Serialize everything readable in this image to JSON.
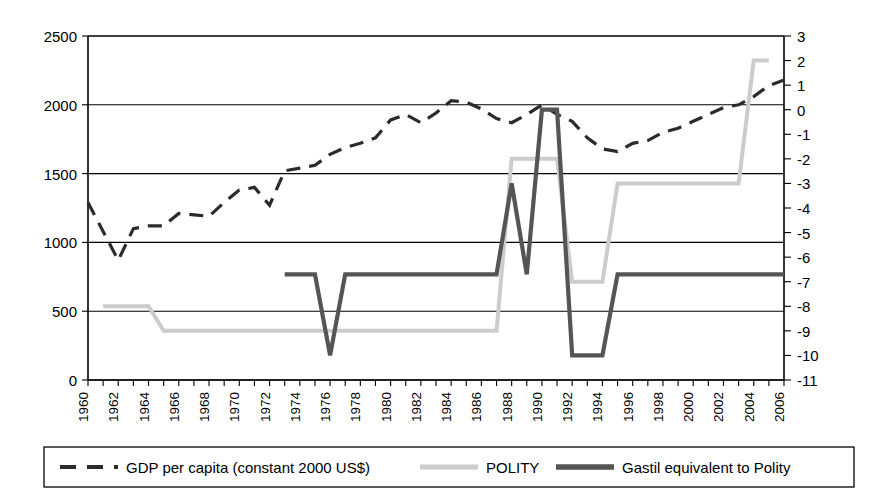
{
  "chart_data": {
    "type": "line",
    "title": "",
    "xlabel": "",
    "ylabel": "",
    "y2label": "",
    "grid": true,
    "legend_position": "bottom",
    "x": [
      1960,
      1961,
      1962,
      1963,
      1964,
      1965,
      1966,
      1967,
      1968,
      1969,
      1970,
      1971,
      1972,
      1973,
      1974,
      1975,
      1976,
      1977,
      1978,
      1979,
      1980,
      1981,
      1982,
      1983,
      1984,
      1985,
      1986,
      1987,
      1988,
      1989,
      1990,
      1991,
      1992,
      1993,
      1994,
      1995,
      1996,
      1997,
      1998,
      1999,
      2000,
      2001,
      2002,
      2003,
      2004,
      2005,
      2006
    ],
    "xticks": [
      1960,
      1962,
      1964,
      1966,
      1968,
      1970,
      1972,
      1974,
      1976,
      1978,
      1980,
      1982,
      1984,
      1986,
      1988,
      1990,
      1992,
      1994,
      1996,
      1998,
      2000,
      2002,
      2004,
      2006
    ],
    "xticklabels": [
      "1960",
      "1962",
      "1964",
      "1966",
      "1968",
      "1970",
      "1972",
      "1974",
      "1976",
      "1978",
      "1980",
      "1982",
      "1984",
      "1986",
      "1988",
      "1990",
      "1992",
      "1994",
      "1996",
      "1998",
      "2000",
      "2002",
      "2004",
      "2006"
    ],
    "xlim": [
      1960,
      2006
    ],
    "ylim": [
      0,
      2500
    ],
    "yticks": [
      0,
      500,
      1000,
      1500,
      2000,
      2500
    ],
    "yticklabels": [
      "0",
      "500",
      "1000",
      "1500",
      "2000",
      "2500"
    ],
    "y2lim": [
      -11,
      3
    ],
    "y2ticks": [
      -11,
      -10,
      -9,
      -8,
      -7,
      -6,
      -5,
      -4,
      -3,
      -2,
      -1,
      0,
      1,
      2,
      3
    ],
    "y2ticklabels": [
      "-11",
      "-10",
      "-9",
      "-8",
      "-7",
      "-6",
      "-5",
      "-4",
      "-3",
      "-2",
      "-1",
      "0",
      "1",
      "2",
      "3"
    ],
    "series": [
      {
        "name": "GDP per capita (constant 2000 US$)",
        "key": "gdp",
        "axis": "left",
        "style": "dashed",
        "color": "#2b2b2b",
        "width": 3.2,
        "x": [
          1960,
          1961,
          1962,
          1963,
          1964,
          1965,
          1966,
          1967,
          1968,
          1969,
          1970,
          1971,
          1972,
          1973,
          1974,
          1975,
          1976,
          1977,
          1978,
          1979,
          1980,
          1981,
          1982,
          1983,
          1984,
          1985,
          1986,
          1987,
          1988,
          1989,
          1990,
          1991,
          1992,
          1993,
          1994,
          1995,
          1996,
          1997,
          1998,
          1999,
          2000,
          2001,
          2002,
          2003,
          2004,
          2005,
          2006
        ],
        "values": [
          1290,
          1080,
          870,
          1100,
          1120,
          1120,
          1210,
          1200,
          1190,
          1290,
          1380,
          1400,
          1270,
          1520,
          1540,
          1560,
          1640,
          1690,
          1720,
          1760,
          1890,
          1930,
          1870,
          1940,
          2030,
          2020,
          1970,
          1900,
          1870,
          1930,
          2000,
          1930,
          1880,
          1760,
          1680,
          1660,
          1720,
          1740,
          1800,
          1830,
          1880,
          1930,
          1980,
          2000,
          2060,
          2140,
          2180
        ]
      },
      {
        "name": "POLITY",
        "key": "polity",
        "axis": "right",
        "style": "solid",
        "color": "#cccccc",
        "width": 4.0,
        "x": [
          1961,
          1962,
          1963,
          1964,
          1965,
          1966,
          1967,
          1968,
          1969,
          1970,
          1971,
          1972,
          1973,
          1974,
          1975,
          1976,
          1977,
          1978,
          1979,
          1980,
          1981,
          1982,
          1983,
          1984,
          1985,
          1986,
          1987,
          1988,
          1989,
          1990,
          1991,
          1992,
          1993,
          1994,
          1995,
          1996,
          1997,
          1998,
          1999,
          2000,
          2001,
          2002,
          2003,
          2004,
          2005
        ],
        "values": [
          -8,
          -8,
          -8,
          -8,
          -9,
          -9,
          -9,
          -9,
          -9,
          -9,
          -9,
          -9,
          -9,
          -9,
          -9,
          -9,
          -9,
          -9,
          -9,
          -9,
          -9,
          -9,
          -9,
          -9,
          -9,
          -9,
          -9,
          -2,
          -2,
          -2,
          -2,
          -7,
          -7,
          -7,
          -3,
          -3,
          -3,
          -3,
          -3,
          -3,
          -3,
          -3,
          -3,
          2,
          2
        ]
      },
      {
        "name": "Gastil equivalent to Polity",
        "key": "gastil",
        "axis": "right",
        "style": "solid",
        "color": "#555555",
        "width": 4.2,
        "x": [
          1973,
          1974,
          1975,
          1976,
          1977,
          1978,
          1979,
          1980,
          1981,
          1982,
          1983,
          1984,
          1985,
          1986,
          1987,
          1988,
          1989,
          1990,
          1991,
          1992,
          1993,
          1994,
          1995,
          1996,
          1997,
          1998,
          1999,
          2000,
          2001,
          2002,
          2003,
          2004,
          2005,
          2006
        ],
        "values": [
          -6.7,
          -6.7,
          -6.7,
          -10,
          -6.7,
          -6.7,
          -6.7,
          -6.7,
          -6.7,
          -6.7,
          -6.7,
          -6.7,
          -6.7,
          -6.7,
          -6.7,
          -3,
          -6.7,
          0,
          0,
          -10,
          -10,
          -10,
          -6.7,
          -6.7,
          -6.7,
          -6.7,
          -6.7,
          -6.7,
          -6.7,
          -6.7,
          -6.7,
          -6.7,
          -6.7,
          -6.7
        ]
      }
    ],
    "legend": [
      {
        "label": "GDP per capita (constant 2000 US$)",
        "style": "dashed",
        "color": "#2b2b2b"
      },
      {
        "label": "POLITY",
        "style": "solid",
        "color": "#cccccc"
      },
      {
        "label": "Gastil equivalent to Polity",
        "style": "solid",
        "color": "#555555"
      }
    ]
  }
}
